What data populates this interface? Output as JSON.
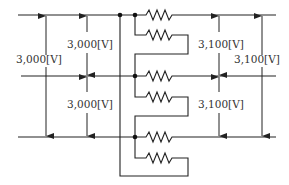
{
  "diagram": {
    "type": "electrical-circuit",
    "colors": {
      "line": "#222222",
      "text": "#333333",
      "background": "#ffffff"
    },
    "lines": [
      "top-line",
      "middle-line",
      "bottom-line"
    ],
    "labels": {
      "left_total": "3,000[V]",
      "left_upper": "3,000[V]",
      "left_lower": "3,000[V]",
      "right_upper": "3,100[V]",
      "right_lower": "3,100[V]",
      "right_total": "3,100[V]"
    },
    "resistor_count": 6
  }
}
